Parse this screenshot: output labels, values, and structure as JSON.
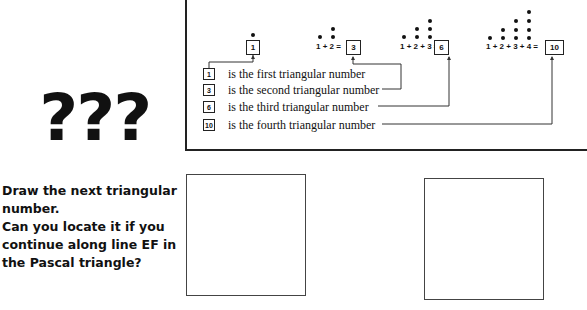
{
  "diagram": {
    "sums": [
      {
        "expression": "",
        "result": "1"
      },
      {
        "expression": "1 + 2 =",
        "result": "3"
      },
      {
        "expression": "1 + 2 + 3 =",
        "result": "6"
      },
      {
        "expression": "1 + 2 + 3 + 4 =",
        "result": "10"
      }
    ],
    "legend": [
      {
        "number": "1",
        "text": "is the first triangular number"
      },
      {
        "number": "3",
        "text": "is the second triangular number"
      },
      {
        "number": "6",
        "text": "is the third triangular number"
      },
      {
        "number": "10",
        "text": "is the fourth triangular number"
      }
    ]
  },
  "decoration": {
    "question_marks": "???"
  },
  "prompt": {
    "line1": "Draw the next triangular number.",
    "line2": "Can you locate it if you continue along line EF in the Pascal triangle?"
  },
  "answer_boxes": [
    {
      "label": ""
    },
    {
      "label": ""
    }
  ]
}
